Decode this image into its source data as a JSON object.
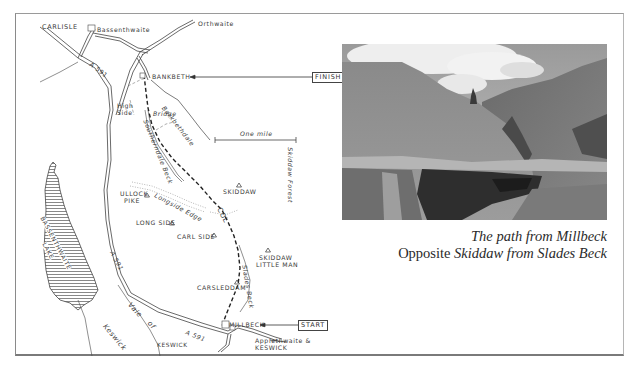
{
  "map": {
    "places": {
      "carlisle": "CARLISLE",
      "bassenthwaite": "Bassenthwaite",
      "orthwaite": "Orthwaite",
      "bassenthwaite_road_no": "A591",
      "bassenthwaite_a591_north": "A 591",
      "bankbeth": "BANKBETH",
      "high_side_line1": "High",
      "high_side_line2": "Side",
      "bridge": "Bridge",
      "barkbethdale": "Barkbethdale",
      "southerndale_beck": "Southerndale Beck",
      "ullock_pike_line1": "ULLOCK",
      "ullock_pike_line2": "PIKE",
      "longside_edge": "Longside Edge",
      "long_side": "LONG SIDE",
      "skiddaw": "SKIDDAW",
      "col": "COL",
      "carl_side": "CARL SIDE",
      "skiddaw_little_man_line1": "SKIDDAW",
      "skiddaw_little_man_line2": "LITTLE MAN",
      "slades_beck": "Slades Beck",
      "carsleddam": "CARSLEDDAM",
      "millbeck": "MILLBECK",
      "applethwaite_line1": "Applethwaite &",
      "applethwaite_line2": "KESWICK",
      "keswick": "KESWICK",
      "vale_of_keswick_1": "Vale",
      "vale_of_keswick_2": "of",
      "vale_of_keswick_3": "Keswick",
      "a591_middle": "A 591",
      "a591_south": "A 591",
      "lake_line1": "BASSENTHWAITE",
      "lake_line2": "LAKE",
      "skiddaw_forest": "Skiddaw Forest"
    },
    "scale_label": "One mile",
    "markers": {
      "finish": "FINISH",
      "start": "START"
    }
  },
  "photo": {
    "alt": "Grassy fellside valley with stream and path, single tree on skyline"
  },
  "caption": {
    "line1": "The path from Millbeck",
    "line2_prefix": "Opposite ",
    "line2_italic": "Skiddaw from Slades Beck"
  },
  "colors": {
    "ink": "#3a3a3a",
    "frame": "#8a8a8a",
    "lake_hatch": "#555555"
  }
}
